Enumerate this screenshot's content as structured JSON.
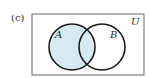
{
  "figure": {
    "part_label": "(c)",
    "universe_label": "U",
    "set_a_label": "A",
    "set_b_label": "B",
    "shaded_region": "A",
    "colors": {
      "shade": "#d5eaf2",
      "stroke": "#1a1a1a",
      "frame": "#555555",
      "background": "#ffffff"
    }
  }
}
